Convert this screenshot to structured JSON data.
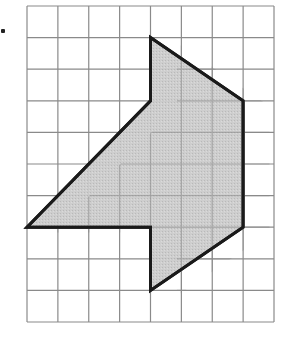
{
  "figure": {
    "title": "",
    "grid": {
      "cols": 8,
      "rows": 10,
      "x0": 27,
      "y0": 6,
      "x1": 274,
      "y1": 322,
      "line_color": "#8a8a8a"
    },
    "shape": {
      "fill": "#c9c9c9",
      "stroke": "#1a1a1a",
      "stroke_width": 3,
      "vertices_grid": [
        [
          4,
          1
        ],
        [
          7,
          3
        ],
        [
          7,
          7
        ],
        [
          4,
          9
        ],
        [
          4,
          7
        ],
        [
          0,
          7
        ],
        [
          4,
          3
        ]
      ]
    },
    "bullet_marker": true
  }
}
